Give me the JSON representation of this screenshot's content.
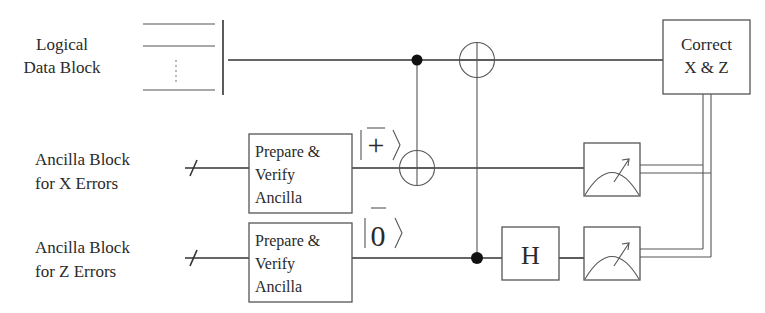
{
  "diagram": {
    "type": "quantum-circuit",
    "rows": [
      {
        "id": "data",
        "label_lines": [
          "Logical",
          "Data Block"
        ]
      },
      {
        "id": "ancilla_x",
        "label_lines": [
          "Ancilla Block",
          "for X Errors"
        ]
      },
      {
        "id": "ancilla_z",
        "label_lines": [
          "Ancilla Block",
          "for Z Errors"
        ]
      }
    ],
    "gates": {
      "prepare_x": {
        "label_lines": [
          "Prepare &",
          "Verify",
          "Ancilla"
        ]
      },
      "prepare_z": {
        "label_lines": [
          "Prepare &",
          "Verify",
          "Ancilla"
        ]
      },
      "ket_plus": {
        "symbol": "+",
        "overbar": true
      },
      "ket_zero": {
        "symbol": "0",
        "overbar": true
      },
      "hadamard": {
        "label": "H"
      },
      "correct": {
        "label_lines": [
          "Correct",
          "X & Z"
        ]
      },
      "measure_x": {
        "icon": "meter-icon"
      },
      "measure_z": {
        "icon": "meter-icon"
      }
    },
    "connections": [
      {
        "type": "cnot",
        "control": "data",
        "target": "ancilla_x"
      },
      {
        "type": "cnot",
        "control": "ancilla_z",
        "target": "data"
      },
      {
        "type": "classical",
        "from": "measure_x",
        "to": "correct"
      },
      {
        "type": "classical",
        "from": "measure_z",
        "to": "correct"
      }
    ],
    "colors": {
      "line": "#333333",
      "box_stroke": "#555555",
      "background": "#ffffff"
    }
  }
}
